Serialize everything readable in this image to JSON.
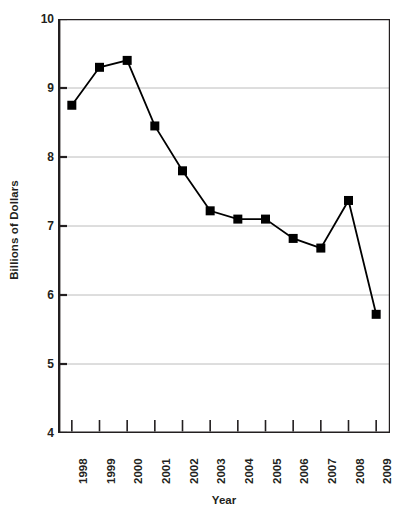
{
  "chart_data": {
    "type": "line",
    "title": "",
    "xlabel": "Year",
    "ylabel": "Billions of Dollars",
    "categories": [
      "1998",
      "1999",
      "2000",
      "2001",
      "2002",
      "2003",
      "2004",
      "2005",
      "2006",
      "2007",
      "2008",
      "2009"
    ],
    "values": [
      8.75,
      9.3,
      9.4,
      8.45,
      7.8,
      7.22,
      7.1,
      7.1,
      6.82,
      6.68,
      7.37,
      5.72
    ],
    "ylim": [
      4,
      10
    ],
    "yticks": [
      4,
      5,
      6,
      7,
      8,
      9,
      10
    ],
    "ytick_labels": [
      "4",
      "5",
      "6",
      "7",
      "8",
      "9",
      "10"
    ],
    "grid": true,
    "grid_axis": "y",
    "legend": false,
    "legend_position": "none",
    "marker": "square",
    "line_color": "#000000",
    "marker_color": "#000000",
    "grid_color": "#bcbcbc",
    "axis_color": "#231f20",
    "background": "#ffffff"
  },
  "axes": {
    "y_title": "Billions of Dollars",
    "x_title": "Year"
  },
  "caption": {
    "sliver_text": ""
  }
}
